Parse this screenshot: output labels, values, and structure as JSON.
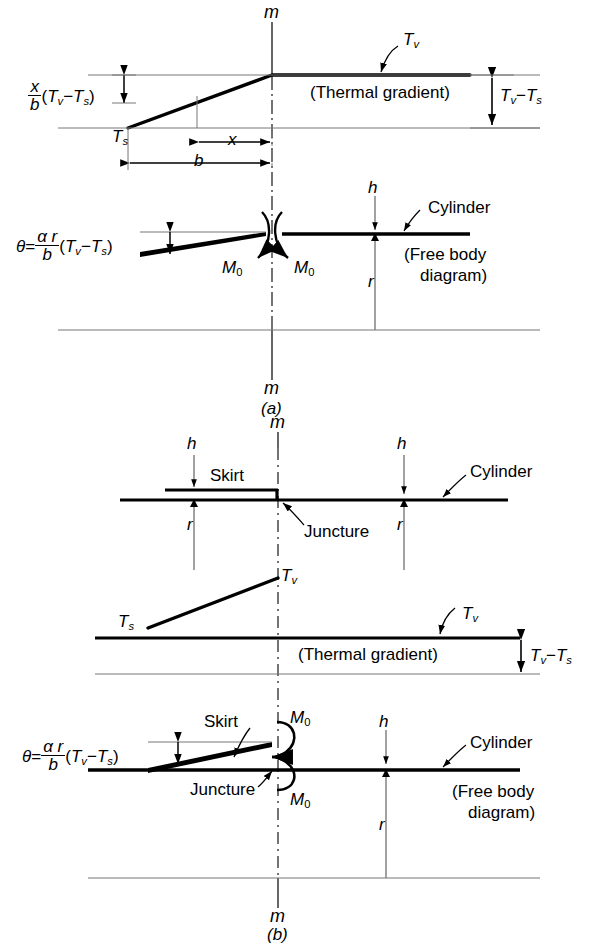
{
  "figure": {
    "panels": [
      "(a)",
      "(b)"
    ]
  },
  "symbols": {
    "centerline": "m",
    "Ts": "T",
    "Ts_sub": "s",
    "Tv": "T",
    "Tv_sub": "v",
    "x": "x",
    "b": "b",
    "h": "h",
    "r": "r",
    "M0": "M",
    "M0_sub": "0",
    "theta": "θ",
    "alpha": "α",
    "equals": "=",
    "minus": "−",
    "paren_open": "(",
    "paren_close": ")"
  },
  "panel_a": {
    "label": "(a)",
    "centerline_top": "m",
    "centerline_bottom": "m",
    "gradient": {
      "caption": "(Thermal gradient)",
      "Ts_label": "T",
      "Ts_sub": "s",
      "Tv_label": "T",
      "Tv_sub": "v",
      "x_dim": "x",
      "b_dim": "b",
      "right_bracket_num": "T",
      "right_bracket_num_sub": "v",
      "right_bracket_minus": "−",
      "right_bracket_den": "T",
      "right_bracket_den_sub": "s",
      "left_formula": {
        "frac_num": "x",
        "frac_den": "b",
        "open": "(",
        "t1": "T",
        "t1_sub": "v",
        "minus": "−",
        "t2": "T",
        "t2_sub": "s",
        "close": ")"
      }
    },
    "freebody": {
      "caption_line1": "(Free body",
      "caption_line2": "diagram)",
      "cylinder_label": "Cylinder",
      "h_label": "h",
      "r_label": "r",
      "M0_left": "M",
      "M0_left_sub": "0",
      "M0_right": "M",
      "M0_right_sub": "0",
      "theta_formula": {
        "theta": "θ",
        "equals": "=",
        "frac_num_alpha": "α",
        "frac_num_r": "r",
        "frac_den": "b",
        "open": "(",
        "t1": "T",
        "t1_sub": "v",
        "minus": "−",
        "t2": "T",
        "t2_sub": "s",
        "close": ")"
      }
    }
  },
  "panel_b": {
    "label": "(b)",
    "centerline_top": "m",
    "centerline_bottom": "m",
    "geometry": {
      "skirt_label": "Skirt",
      "juncture_label": "Juncture",
      "cylinder_label": "Cylinder",
      "h_left": "h",
      "h_right": "h",
      "r_left": "r",
      "r_right": "r"
    },
    "gradient": {
      "caption": "(Thermal gradient)",
      "Ts_label": "T",
      "Ts_sub": "s",
      "Tv_peak_label": "T",
      "Tv_peak_sub": "v",
      "Tv_right_label": "T",
      "Tv_right_sub": "v",
      "right_bracket_num": "T",
      "right_bracket_num_sub": "v",
      "right_bracket_minus": "−",
      "right_bracket_den": "T",
      "right_bracket_den_sub": "s"
    },
    "freebody": {
      "caption_line1": "(Free body",
      "caption_line2": "diagram)",
      "cylinder_label": "Cylinder",
      "skirt_label": "Skirt",
      "juncture_label": "Juncture",
      "h_label": "h",
      "r_label": "r",
      "M0_top": "M",
      "M0_top_sub": "0",
      "M0_bottom": "M",
      "M0_bottom_sub": "0",
      "theta_formula": {
        "theta": "θ",
        "equals": "=",
        "frac_num_alpha": "α",
        "frac_num_r": "r",
        "frac_den": "b",
        "open": "(",
        "t1": "T",
        "t1_sub": "v",
        "minus": "−",
        "t2": "T",
        "t2_sub": "s",
        "close": ")"
      }
    }
  },
  "colors": {
    "ink": "#000000",
    "thin": "#555555",
    "paper": "#ffffff"
  }
}
